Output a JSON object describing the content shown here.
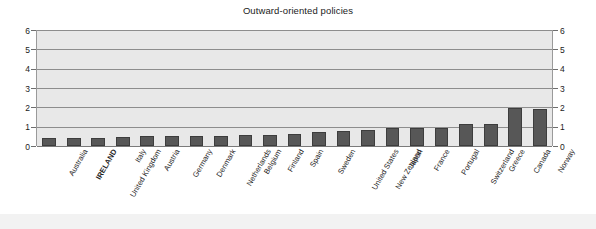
{
  "chart_data": {
    "type": "bar",
    "title": "Outward-oriented policies",
    "xlabel": "",
    "ylabel": "",
    "ylim": [
      0,
      6
    ],
    "yticks": [
      0,
      1,
      2,
      3,
      4,
      5,
      6
    ],
    "grid": true,
    "legend": false,
    "dual_axis": true,
    "highlight_category": "IRELAND",
    "bar_color": "#575757",
    "plot_background": "#e8e8e8",
    "categories": [
      "Australia",
      "IRELAND",
      "United Kingdom",
      "Italy",
      "Austria",
      "Germany",
      "Denmark",
      "Netherlands",
      "Belgium",
      "Finland",
      "Spain",
      "Sweden",
      "United States",
      "New Zealand",
      "Japan",
      "France",
      "Portugal",
      "Switzerland",
      "Greece",
      "Canada",
      "Norway"
    ],
    "values": [
      0.4,
      0.4,
      0.42,
      0.48,
      0.5,
      0.5,
      0.5,
      0.52,
      0.58,
      0.58,
      0.62,
      0.75,
      0.78,
      0.82,
      0.92,
      0.92,
      0.93,
      1.13,
      1.13,
      1.95,
      1.93
    ]
  },
  "axis": {
    "left_ticks": [
      "0",
      "1",
      "2",
      "3",
      "4",
      "5",
      "6"
    ],
    "right_ticks": [
      "0",
      "1",
      "2",
      "3",
      "4",
      "5",
      "6"
    ]
  }
}
